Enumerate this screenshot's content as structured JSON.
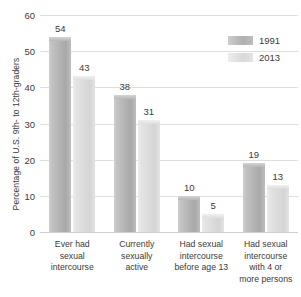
{
  "chart_data": {
    "type": "bar",
    "title": "",
    "xlabel": "",
    "ylabel": "Percentage of U.S. 9th- to 12th-graders",
    "ylim": [
      0,
      60
    ],
    "yticks": [
      0,
      10,
      20,
      30,
      40,
      50,
      60
    ],
    "ytick_labels": [
      "0",
      "10",
      "20",
      "30",
      "40",
      "50",
      "60"
    ],
    "grid": true,
    "legend_position": "top-right",
    "categories": [
      "Ever had sexual intercourse",
      "Currently sexually active",
      "Had sexual intercourse before age 13",
      "Had sexual intercourse with 4 or more persons"
    ],
    "category_lines": [
      [
        "Ever had",
        "sexual",
        "intercourse"
      ],
      [
        "Currently",
        "sexually",
        "active"
      ],
      [
        "Had sexual",
        "intercourse",
        "before age 13"
      ],
      [
        "Had sexual",
        "intercourse",
        "with 4 or",
        "more persons"
      ]
    ],
    "series": [
      {
        "name": "1991",
        "color": "#b4b4b4",
        "values": [
          54,
          38,
          10,
          19
        ]
      },
      {
        "name": "2013",
        "color": "#dcdcdc",
        "values": [
          43,
          31,
          5,
          13
        ]
      }
    ]
  },
  "legend": {
    "items": [
      {
        "label": "1991"
      },
      {
        "label": "2013"
      }
    ]
  }
}
